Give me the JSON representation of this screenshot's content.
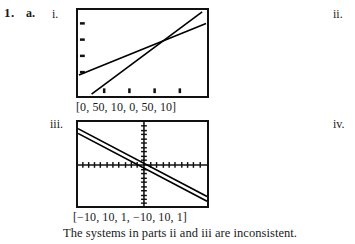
{
  "exercise": {
    "number": "1.",
    "part": "a.",
    "roman_i": "i.",
    "roman_ii": "ii.",
    "roman_iii": "iii.",
    "roman_iv": "iv."
  },
  "graphs": {
    "i": {
      "caption": "[0, 50, 10, 0, 50, 10]",
      "window": {
        "xmin": 0,
        "xmax": 50,
        "xscl": 10,
        "ymin": 0,
        "ymax": 50,
        "yscl": 10
      },
      "lines": [
        {
          "name": "line-1",
          "x1": 0,
          "y1": 11,
          "x2": 50,
          "y2": 47
        },
        {
          "name": "line-2",
          "x1": 5,
          "y1": 0,
          "x2": 48,
          "y2": 52
        }
      ],
      "axes_shown": "bottom-left-edges",
      "tick_marks": "on-left-and-bottom-border"
    },
    "iii": {
      "caption": "[−10, 10, 1, −10, 10, 1]",
      "window": {
        "xmin": -10,
        "xmax": 10,
        "xscl": 1,
        "ymin": -10,
        "ymax": 10,
        "yscl": 1
      },
      "lines": [
        {
          "name": "line-1",
          "x1": -10,
          "y1": 8.6,
          "x2": 10,
          "y2": -7.6
        },
        {
          "name": "line-2",
          "x1": -10,
          "y1": 7.4,
          "x2": 10,
          "y2": -8.8
        }
      ],
      "axes_shown": "x-and-y-axes-with-ticks"
    }
  },
  "answer": {
    "text": "The systems in parts ii and iii are inconsistent."
  },
  "colors": {
    "ink": "#1a1a1a",
    "screen_border": "#111111",
    "plot": "#000000",
    "paper": "#ffffff"
  }
}
